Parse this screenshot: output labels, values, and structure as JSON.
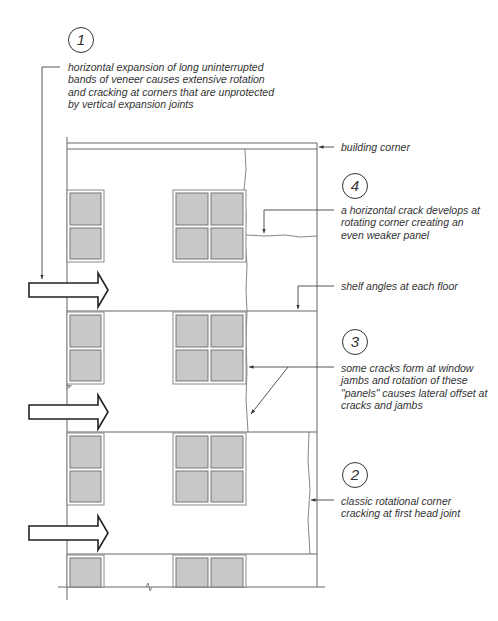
{
  "diagram": {
    "colors": {
      "line": "#555555",
      "pane": "#c8c8c8",
      "text": "#333333",
      "background": "#ffffff"
    }
  },
  "callouts": [
    {
      "id": "1",
      "number": "1",
      "lines": [
        "horizontal expansion of long uninterrupted",
        "bands of veneer causes extensive rotation",
        "and cracking at corners that are unprotected",
        "by vertical expansion joints"
      ]
    },
    {
      "id": "building-corner",
      "number": null,
      "lines": [
        "building corner"
      ]
    },
    {
      "id": "4",
      "number": "4",
      "lines": [
        "a horizontal crack develops at",
        "rotating corner creating an",
        "even weaker panel"
      ]
    },
    {
      "id": "shelf-angles",
      "number": null,
      "lines": [
        "shelf angles at each floor"
      ]
    },
    {
      "id": "3",
      "number": "3",
      "lines": [
        "some cracks form at window",
        "jambs and rotation of these",
        "\"panels\" causes lateral offset at",
        "cracks and jambs"
      ]
    },
    {
      "id": "2",
      "number": "2",
      "lines": [
        "classic rotational corner",
        "cracking at first head joint"
      ]
    }
  ],
  "elevation": {
    "floors": 4,
    "expansion_arrows": 3,
    "windows_per_floor": [
      "narrow 1x2 pane",
      "wide 2x2 pane"
    ]
  }
}
